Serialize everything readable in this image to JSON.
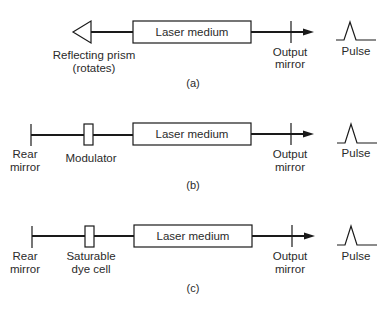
{
  "diagram": {
    "type": "laser-pulse-configurations",
    "panels": [
      {
        "id": "a",
        "caption": "(a)",
        "rear_element": {
          "kind": "prism",
          "label_lines": [
            "Reflecting prism",
            "(rotates)"
          ]
        },
        "intracavity_element": null,
        "medium_label": "Laser medium",
        "output_label_lines": [
          "Output",
          "mirror"
        ],
        "pulse_label": "Pulse"
      },
      {
        "id": "b",
        "caption": "(b)",
        "rear_element": {
          "kind": "mirror",
          "label_lines": [
            "Rear",
            "mirror"
          ]
        },
        "intracavity_element": {
          "kind": "modulator",
          "label_lines": [
            "Modulator"
          ]
        },
        "medium_label": "Laser medium",
        "output_label_lines": [
          "Output",
          "mirror"
        ],
        "pulse_label": "Pulse"
      },
      {
        "id": "c",
        "caption": "(c)",
        "rear_element": {
          "kind": "mirror",
          "label_lines": [
            "Rear",
            "mirror"
          ]
        },
        "intracavity_element": {
          "kind": "saturable-dye-cell",
          "label_lines": [
            "Saturable",
            "dye cell"
          ]
        },
        "medium_label": "Laser medium",
        "output_label_lines": [
          "Output",
          "mirror"
        ],
        "pulse_label": "Pulse"
      }
    ]
  }
}
